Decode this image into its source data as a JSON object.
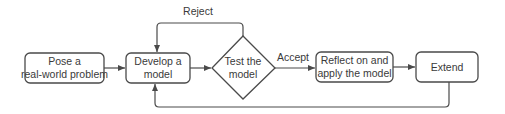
{
  "diagram": {
    "type": "flowchart",
    "colors": {
      "stroke": "#4a4a4a",
      "text": "#3a3a3a",
      "background": "#ffffff"
    },
    "nodes": [
      {
        "id": "pose",
        "shape": "rounded-rect",
        "lines": [
          "Pose a",
          "real-world problem"
        ]
      },
      {
        "id": "develop",
        "shape": "rounded-rect",
        "lines": [
          "Develop a",
          "model"
        ]
      },
      {
        "id": "test",
        "shape": "diamond",
        "lines": [
          "Test the",
          "model"
        ]
      },
      {
        "id": "reflect",
        "shape": "rounded-rect",
        "lines": [
          "Reflect on and",
          "apply the model"
        ]
      },
      {
        "id": "extend",
        "shape": "rounded-rect",
        "lines": [
          "Extend"
        ]
      }
    ],
    "edges": [
      {
        "from": "pose",
        "to": "develop",
        "label": ""
      },
      {
        "from": "develop",
        "to": "test",
        "label": ""
      },
      {
        "from": "test",
        "to": "develop",
        "label": "Reject"
      },
      {
        "from": "test",
        "to": "reflect",
        "label": "Accept"
      },
      {
        "from": "reflect",
        "to": "extend",
        "label": ""
      },
      {
        "from": "extend",
        "to": "develop",
        "label": ""
      }
    ]
  }
}
